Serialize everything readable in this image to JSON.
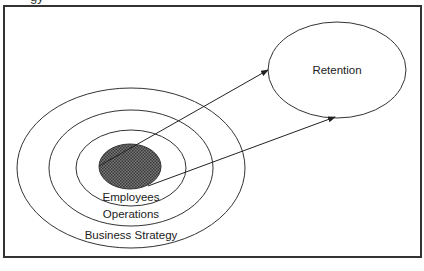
{
  "caption_fragment": "gy",
  "diagram": {
    "title": "",
    "nodes": {
      "core": {
        "label": "",
        "fill": "#555555",
        "pattern": "crosshatch"
      },
      "employees": {
        "label": "Employees"
      },
      "operations": {
        "label": "Operations"
      },
      "business_strategy": {
        "label": "Business Strategy"
      },
      "retention": {
        "label": "Retention"
      }
    },
    "edges": [
      {
        "from": "core",
        "to": "retention",
        "style": "arrow"
      },
      {
        "from": "core",
        "to": "retention",
        "style": "arrow"
      }
    ],
    "colors": {
      "stroke": "#333333",
      "core_fill": "#555555",
      "background": "#ffffff"
    }
  }
}
